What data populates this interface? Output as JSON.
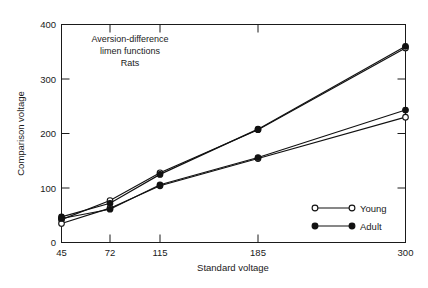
{
  "chart_data": {
    "type": "line",
    "title": "",
    "annotation_lines": [
      "Aversion-difference",
      "limen functions",
      "Rats"
    ],
    "xlabel": "Standard voltage",
    "ylabel": "Comparison voltage",
    "x": [
      45,
      72,
      115,
      185,
      300
    ],
    "xtick_labels": [
      "45",
      "72",
      "115",
      "185",
      "300"
    ],
    "ytick_labels": [
      "0",
      "100",
      "200",
      "300",
      "400"
    ],
    "yticks": [
      0,
      100,
      200,
      300,
      400
    ],
    "ylim": [
      0,
      400
    ],
    "xscale": "log-like ordinal",
    "grid": false,
    "legend_position": "lower-right inside plot",
    "series": [
      {
        "name": "Young",
        "group": "upper",
        "marker": "open-circle",
        "values": [
          42,
          77,
          128,
          207,
          357
        ]
      },
      {
        "name": "Adult",
        "group": "upper",
        "marker": "filled-circle",
        "values": [
          47,
          72,
          125,
          208,
          360
        ]
      },
      {
        "name": "Young",
        "group": "lower",
        "marker": "open-circle",
        "values": [
          35,
          63,
          104,
          154,
          230
        ]
      },
      {
        "name": "Adult",
        "group": "lower",
        "marker": "filled-circle",
        "values": [
          44,
          61,
          106,
          156,
          243
        ]
      }
    ],
    "legend": [
      {
        "label": "Young",
        "marker": "open-circle"
      },
      {
        "label": "Adult",
        "marker": "filled-circle"
      }
    ],
    "colors": {
      "line": "#111111",
      "text": "#1a1a1a",
      "background": "#ffffff"
    }
  }
}
